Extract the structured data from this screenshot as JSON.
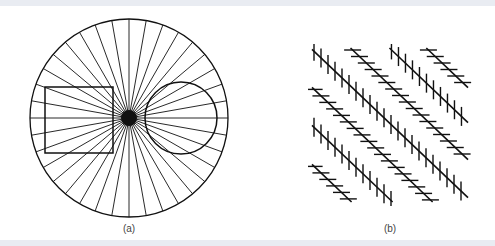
{
  "figure": {
    "background": "#ffffff",
    "band_color": "#e9ecf2",
    "ink_color": "#111111",
    "width": 495,
    "height": 246
  },
  "panels": [
    {
      "id": "a",
      "label": "(a)",
      "label_x": 129,
      "description": "Radiating lines with a square and a circle",
      "outer_circle": {
        "cx": 129,
        "cy": 118,
        "r": 99
      },
      "center_dot": {
        "cx": 129,
        "cy": 118,
        "r": 8
      },
      "ray_count": 36,
      "square": {
        "x": 45,
        "y": 87,
        "width": 68,
        "height": 66
      },
      "inner_circle": {
        "cx": 181,
        "cy": 118,
        "r": 36
      }
    },
    {
      "id": "b",
      "label": "(b)",
      "label_x": 390,
      "description": "Parallel diagonals with alternating vertical and horizontal hatch marks",
      "clip": {
        "x0": 312,
        "y0": 48,
        "x1": 468,
        "y1": 202
      },
      "slope": 0.95,
      "diagonals": [
        {
          "intercept": -357,
          "hatch": "horizontal"
        },
        {
          "intercept": -322,
          "hatch": "vertical"
        },
        {
          "intercept": -285,
          "hatch": "horizontal"
        },
        {
          "intercept": -247,
          "hatch": "vertical"
        },
        {
          "intercept": -209,
          "hatch": "horizontal"
        },
        {
          "intercept": -171,
          "hatch": "vertical"
        },
        {
          "intercept": -132,
          "hatch": "horizontal"
        }
      ],
      "hatch_vertical": {
        "length": 19,
        "spacing": 7
      },
      "hatch_horizontal": {
        "length": 17,
        "spacing": 6.5
      }
    }
  ]
}
